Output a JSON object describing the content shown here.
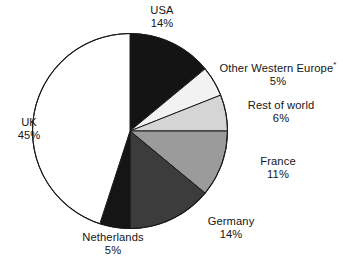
{
  "chart_data": {
    "type": "pie",
    "title": "",
    "subtitle": "",
    "xlabel": "",
    "ylabel": "",
    "legend_position": "none",
    "grid": false,
    "units": "%",
    "start_angle_deg": 0,
    "direction": "clockwise",
    "total": 100,
    "footnote_marker": "*",
    "categories": [
      "USA",
      "Other Western Europe*",
      "Rest of world",
      "France",
      "Germany",
      "Netherlands",
      "UK"
    ],
    "values": [
      14,
      5,
      6,
      11,
      14,
      5,
      45
    ],
    "slices": [
      {
        "name": "USA",
        "value": 14,
        "value_label": "14%",
        "color": "#141414",
        "start_deg": 0,
        "end_deg": 50.4
      },
      {
        "name": "Other Western Europe*",
        "value": 5,
        "value_label": "5%",
        "color": "#f2f2f2",
        "start_deg": 50.4,
        "end_deg": 68.4
      },
      {
        "name": "Rest of world",
        "value": 6,
        "value_label": "6%",
        "color": "#d5d5d5",
        "start_deg": 68.4,
        "end_deg": 90.0
      },
      {
        "name": "France",
        "value": 11,
        "value_label": "11%",
        "color": "#9b9b9b",
        "start_deg": 90.0,
        "end_deg": 129.6
      },
      {
        "name": "Germany",
        "value": 14,
        "value_label": "14%",
        "color": "#3c3c3c",
        "start_deg": 129.6,
        "end_deg": 180.0
      },
      {
        "name": "Netherlands",
        "value": 5,
        "value_label": "5%",
        "color": "#151515",
        "start_deg": 180.0,
        "end_deg": 198.0
      },
      {
        "name": "UK",
        "value": 45,
        "value_label": "45%",
        "color": "#ffffff",
        "start_deg": 198.0,
        "end_deg": 360.0
      }
    ]
  },
  "labels": {
    "usa": {
      "name": "USA",
      "value": "14%"
    },
    "other_west": {
      "name": "Other Western Europe",
      "marker": "*",
      "value": "5%"
    },
    "rest_world": {
      "name": "Rest of world",
      "value": "6%"
    },
    "france": {
      "name": "France",
      "value": "11%"
    },
    "germany": {
      "name": "Germany",
      "value": "14%"
    },
    "netherlands": {
      "name": "Netherlands",
      "value": "5%"
    },
    "uk": {
      "name": "UK",
      "value": "45%"
    }
  },
  "colors": {
    "background": "#ffffff",
    "outline": "#1a1a1a",
    "text": "#151515"
  }
}
